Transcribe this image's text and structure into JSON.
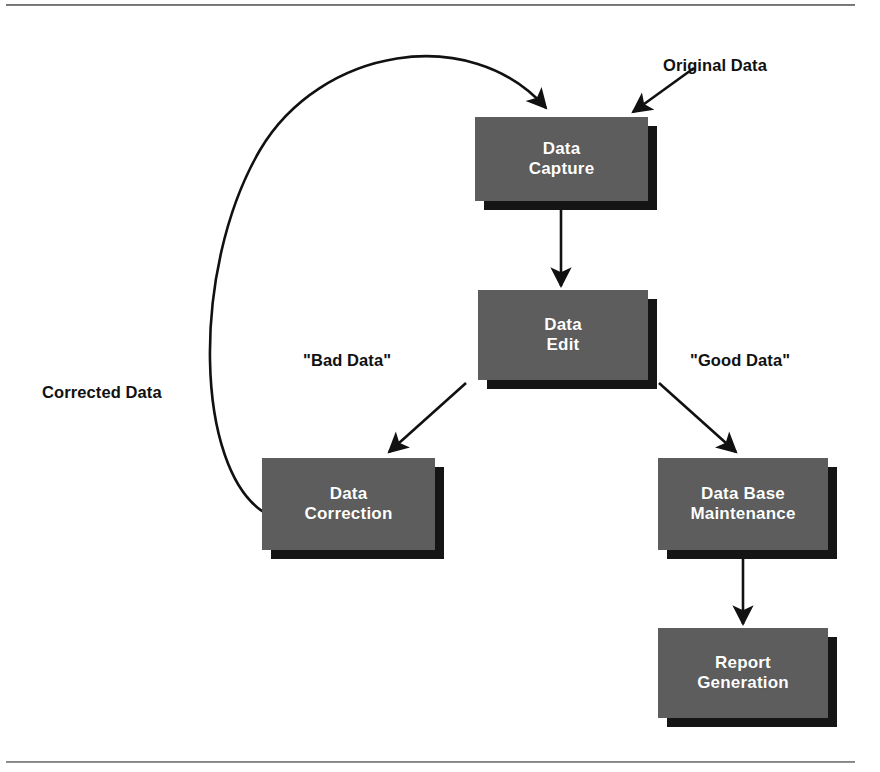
{
  "figure": {
    "background_color": "#ffffff",
    "node_fill_color": "#5d5d5d",
    "node_shadow_color": "#151515",
    "node_text_color": "#ffffff",
    "edge_color": "#111111",
    "rule_color": "#6e6e6e"
  },
  "nodes": [
    {
      "id": "data-capture",
      "label": "Data\nCapture",
      "x": 475,
      "y": 117,
      "w": 173,
      "h": 84
    },
    {
      "id": "data-edit",
      "label": "Data\nEdit",
      "x": 478,
      "y": 290,
      "w": 170,
      "h": 90
    },
    {
      "id": "data-correction",
      "label": "Data\nCorrection",
      "x": 262,
      "y": 458,
      "w": 173,
      "h": 92
    },
    {
      "id": "data-base-maintenance",
      "label": "Data Base\nMaintenance",
      "x": 658,
      "y": 458,
      "w": 170,
      "h": 92
    },
    {
      "id": "report-generation",
      "label": "Report\nGeneration",
      "x": 658,
      "y": 628,
      "w": 170,
      "h": 90
    }
  ],
  "edge_labels": [
    {
      "id": "original-data",
      "text": "Original Data",
      "x": 663,
      "y": 56
    },
    {
      "id": "corrected-data",
      "text": "Corrected Data",
      "x": 42,
      "y": 383
    },
    {
      "id": "bad-data",
      "text": "\"Bad Data\"",
      "x": 303,
      "y": 351
    },
    {
      "id": "good-data",
      "text": "\"Good Data\"",
      "x": 690,
      "y": 351
    }
  ],
  "edges": [
    {
      "id": "original-data-arrow",
      "from": "Original Data label",
      "to": "data-capture"
    },
    {
      "id": "feedback-arrow",
      "from": "data-correction",
      "to": "data-capture",
      "style": "curved"
    },
    {
      "id": "capture-to-edit",
      "from": "data-capture",
      "to": "data-edit"
    },
    {
      "id": "edit-to-correction",
      "from": "data-edit",
      "to": "data-correction"
    },
    {
      "id": "edit-to-maintenance",
      "from": "data-edit",
      "to": "data-base-maintenance"
    },
    {
      "id": "maintenance-to-report",
      "from": "data-base-maintenance",
      "to": "report-generation"
    }
  ]
}
